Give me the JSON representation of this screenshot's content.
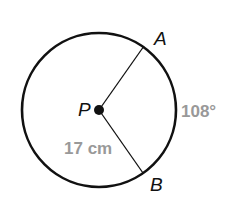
{
  "diagram": {
    "type": "circle-with-central-angle",
    "center": {
      "label": "P",
      "x": 99,
      "y": 110
    },
    "radius_px": 77,
    "points": [
      {
        "label": "A",
        "x": 144,
        "y": 46
      },
      {
        "label": "B",
        "x": 143,
        "y": 173
      }
    ],
    "segments": [
      {
        "from": "P",
        "to": "A"
      },
      {
        "from": "P",
        "to": "B"
      }
    ],
    "labels": {
      "center": "P",
      "point_a": "A",
      "point_b": "B",
      "arc_measure": "108°",
      "radius_length": "17 cm"
    },
    "colors": {
      "stroke": "#111111",
      "measure_text": "#999999",
      "background": "#ffffff"
    }
  }
}
